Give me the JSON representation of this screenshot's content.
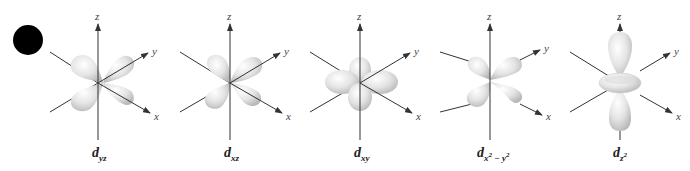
{
  "figure": {
    "bullet": "black-circle",
    "axes": {
      "x": "x",
      "y": "y",
      "z": "z"
    },
    "orbitals": [
      {
        "id": "dyz",
        "name": "d",
        "subscript": "yz",
        "label": "d_yz",
        "shape": "four-lobe-tilted"
      },
      {
        "id": "dxz",
        "name": "d",
        "subscript": "xz",
        "label": "d_xz",
        "shape": "four-lobe-tilted"
      },
      {
        "id": "dxy",
        "name": "d",
        "subscript": "xy",
        "label": "d_xy",
        "shape": "four-lobe-planar"
      },
      {
        "id": "dx2-y2",
        "name": "d",
        "subscript": "x",
        "subscript_sup1": "2",
        "subscript_mid": " − y",
        "subscript_sup2": "2",
        "label": "d_x²−y²",
        "shape": "four-lobe-on-axes"
      },
      {
        "id": "dz2",
        "name": "d",
        "subscript": "z",
        "subscript_sup1": "2",
        "label": "d_z²",
        "shape": "dumbbell-with-torus"
      }
    ],
    "colors": {
      "lobe": "#e6e6e6",
      "lobe_shade": "#bdbdbd",
      "axis": "#333333",
      "background": "#ffffff"
    }
  }
}
